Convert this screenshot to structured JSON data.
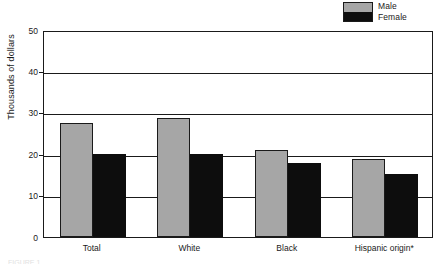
{
  "chart_data": {
    "type": "bar",
    "title": "",
    "subtitle": "",
    "xlabel": "",
    "ylabel": "Thousands of dollars",
    "categories": [
      "Total",
      "White",
      "Black",
      "Hispanic origin*"
    ],
    "series": [
      {
        "name": "Male",
        "color": "#a6a6a6",
        "values": [
          27.6,
          28.7,
          20.9,
          18.9
        ]
      },
      {
        "name": "Female",
        "color": "#0d0d0d",
        "values": [
          20.0,
          20.0,
          17.9,
          15.2
        ]
      }
    ],
    "ylim": [
      0,
      50
    ],
    "ytick_values": [
      0,
      10,
      20,
      30,
      40,
      50
    ],
    "ytick_labels": [
      "0",
      "10",
      "20",
      "30",
      "40",
      "50"
    ],
    "grid": "horizontal",
    "legend_position": "top-right",
    "legend_entries": [
      "Male",
      "Female"
    ],
    "annotations": [
      "*"
    ]
  },
  "legend": {
    "male_label": "Male",
    "female_label": "Female"
  },
  "axes": {
    "y_label": "Thousands of dollars",
    "y_ticks": [
      "50",
      "40",
      "30",
      "20",
      "10",
      "0"
    ],
    "x_ticks": [
      "Total",
      "White",
      "Black",
      "Hispanic origin*"
    ]
  },
  "footer": {
    "artifact_text": "FIGURE 1"
  }
}
